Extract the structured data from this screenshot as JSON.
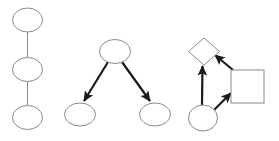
{
  "canvas": {
    "width": 279,
    "height": 141,
    "background_color": "#ffffff",
    "title": "Three graph structures diagram"
  },
  "style": {
    "undirected_edge_color": "#8a8a8a",
    "undirected_edge_width": 1,
    "directed_edge_color": "#1a1a1a",
    "directed_edge_width": 2.2,
    "node_stroke_color": "#8a8a8a",
    "node_stroke_width": 1,
    "node_fill_color": "#ffffff",
    "arrowhead_color": "#1a1a1a"
  },
  "graphs": [
    {
      "id": "graph-chain",
      "name": "vertical-chain-graph",
      "label": "",
      "layout": "vertical-chain",
      "directed": false,
      "nodes": [
        {
          "id": "c1",
          "shape": "ellipse",
          "label": "",
          "cx": 27.5,
          "cy": 20,
          "rx": 15,
          "ry": 12
        },
        {
          "id": "c2",
          "shape": "ellipse",
          "label": "",
          "cx": 27.5,
          "cy": 69.5,
          "rx": 15,
          "ry": 12
        },
        {
          "id": "c3",
          "shape": "ellipse",
          "label": "",
          "cx": 27.5,
          "cy": 117.5,
          "rx": 15,
          "ry": 12
        }
      ],
      "edges": [
        {
          "from": "c1",
          "to": "c2",
          "arrow": false,
          "x1": 27.5,
          "y1": 32,
          "x2": 27.5,
          "y2": 57.5
        },
        {
          "from": "c2",
          "to": "c3",
          "arrow": false,
          "x1": 27.5,
          "y1": 81.5,
          "x2": 27.5,
          "y2": 105.5
        }
      ]
    },
    {
      "id": "graph-tree",
      "name": "branching-tree-graph",
      "label": "",
      "layout": "one-parent-two-children",
      "directed": true,
      "nodes": [
        {
          "id": "p1",
          "shape": "ellipse",
          "label": "",
          "cx": 115,
          "cy": 51.5,
          "rx": 15.5,
          "ry": 12
        },
        {
          "id": "t1",
          "shape": "ellipse",
          "label": "",
          "cx": 80,
          "cy": 114.5,
          "rx": 15.5,
          "ry": 11.5
        },
        {
          "id": "t2",
          "shape": "ellipse",
          "label": "",
          "cx": 155,
          "cy": 114.5,
          "rx": 15.5,
          "ry": 11.5
        }
      ],
      "edges": [
        {
          "from": "p1",
          "to": "t1",
          "arrow": true,
          "x1": 108,
          "y1": 62,
          "x2": 84,
          "y2": 101
        },
        {
          "from": "p1",
          "to": "t2",
          "arrow": true,
          "x1": 122,
          "y1": 62,
          "x2": 150,
          "y2": 101
        }
      ]
    },
    {
      "id": "graph-cycle",
      "name": "mixed-shape-graph",
      "label": "",
      "layout": "triangle",
      "directed": true,
      "nodes": [
        {
          "id": "d1",
          "shape": "diamond",
          "label": "",
          "cx": 204,
          "cy": 51.5,
          "rx": 15.5,
          "ry": 13.5
        },
        {
          "id": "s1",
          "shape": "square",
          "label": "",
          "x": 231,
          "y": 70,
          "width": 33,
          "height": 33
        },
        {
          "id": "o1",
          "shape": "circle",
          "label": "",
          "cx": 203,
          "cy": 118,
          "rx": 14.5,
          "ry": 13
        }
      ],
      "edges": [
        {
          "from": "o1",
          "to": "d1",
          "arrow": true,
          "x1": 202,
          "y1": 105,
          "x2": 202.5,
          "y2": 66
        },
        {
          "from": "o1",
          "to": "s1",
          "arrow": true,
          "x1": 214,
          "y1": 110,
          "x2": 231,
          "y2": 93
        },
        {
          "from": "s1",
          "to": "d1",
          "arrow": true,
          "x1": 233,
          "y1": 70,
          "x2": 215,
          "y2": 55
        }
      ]
    }
  ]
}
